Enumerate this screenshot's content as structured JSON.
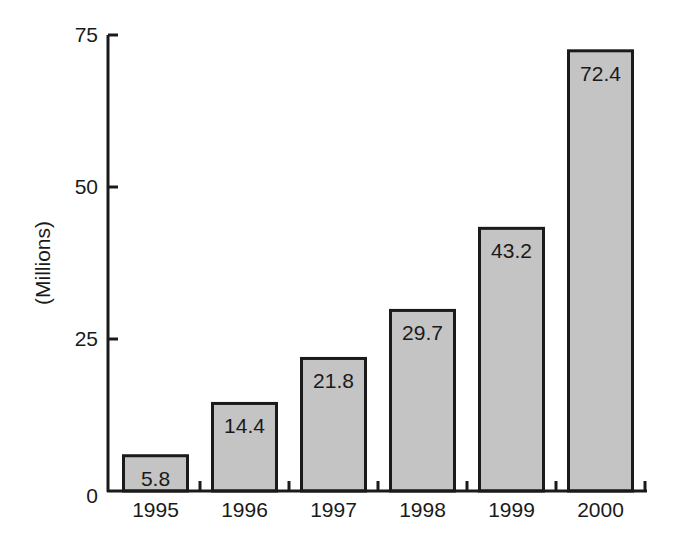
{
  "chart_data": {
    "type": "bar",
    "title": "",
    "xlabel": "",
    "ylabel": "(Millions)",
    "categories": [
      "1995",
      "1996",
      "1997",
      "1998",
      "1999",
      "2000"
    ],
    "values": [
      5.8,
      14.4,
      21.8,
      29.7,
      43.2,
      72.4
    ],
    "data_labels": [
      "5.8",
      "14.4",
      "21.8",
      "29.7",
      "43.2",
      "72.4"
    ],
    "ylim": [
      0,
      75
    ],
    "yticks": [
      0,
      25,
      50,
      75
    ],
    "ytick_labels": [
      "0",
      "25",
      "50",
      "75"
    ],
    "grid": false,
    "legend": null,
    "bar_fill": "#c4c4c4",
    "bar_stroke": "#1a1a1a"
  }
}
